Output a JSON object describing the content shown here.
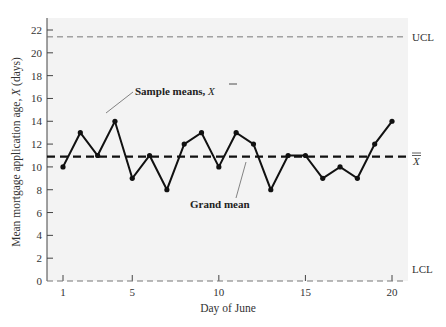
{
  "chart_data": {
    "type": "line",
    "title": "",
    "xlabel": "Day of June",
    "ylabel": "Mean mortgage application age, X̄ (days)",
    "x": [
      1,
      2,
      3,
      4,
      5,
      6,
      7,
      8,
      9,
      10,
      11,
      12,
      13,
      14,
      15,
      16,
      17,
      18,
      19,
      20
    ],
    "series": [
      {
        "name": "Sample means, X̄",
        "values": [
          10,
          13,
          11,
          14,
          9,
          11,
          8,
          12,
          13,
          10,
          13,
          12,
          8,
          11,
          11,
          9,
          10,
          9,
          12,
          14
        ]
      }
    ],
    "reference_lines": [
      {
        "name": "UCL",
        "value": 21.4,
        "style": "dashed-light"
      },
      {
        "name": "X̿",
        "value": 10.9,
        "style": "dashed-bold"
      },
      {
        "name": "LCL",
        "value": 0,
        "style": "dashed-light"
      }
    ],
    "xticks": [
      1,
      5,
      10,
      15,
      20
    ],
    "yticks": [
      0,
      2,
      4,
      6,
      8,
      10,
      12,
      14,
      16,
      18,
      20,
      22
    ],
    "xlim": [
      0,
      21
    ],
    "ylim": [
      0,
      23
    ],
    "grid": false,
    "annotations": [
      {
        "text": "Sample means, X̄",
        "points_to": {
          "x": 4,
          "y": 14
        }
      },
      {
        "text": "Grand mean",
        "points_to": {
          "x": 10.8,
          "y": 10.9
        }
      }
    ],
    "background": "#f3f3f3"
  },
  "labels": {
    "ucl": "UCL",
    "lcl": "LCL",
    "grand_mean_symbol": "X",
    "sample_means": "Sample means, ",
    "sample_means_symbol": "X",
    "grand_mean": "Grand mean",
    "xlabel": "Day of June",
    "ylabel_main": "Mean mortgage application age, ",
    "ylabel_symbol": "X",
    "ylabel_units": " (days)"
  }
}
